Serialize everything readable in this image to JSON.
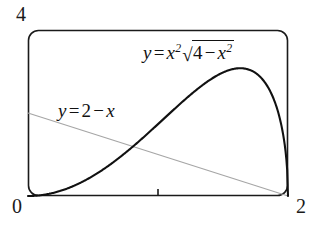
{
  "figure": {
    "type": "function-graph",
    "background_color": "#ffffff",
    "frame": {
      "style": "rounded-rectangle",
      "stroke_color": "#1a1a1a",
      "corner_radius": 10,
      "x_px": 28,
      "y_px": 30,
      "width_px": 260,
      "height_px": 166
    },
    "axis_corner_labels": {
      "y_max": "4",
      "origin": "0",
      "x_max": "2"
    },
    "x_tick_marks": [
      {
        "value": 1,
        "label": ""
      }
    ]
  },
  "annotations": {
    "curve_label": {
      "name": "y = x^2*sqrt(4 - x^2)",
      "lhs_variable": "y",
      "equals": "=",
      "base": "x",
      "base_exponent": "2",
      "radicand_first": "4",
      "radicand_operator": "−",
      "radicand_variable": "x",
      "radicand_exponent": "2",
      "radical_glyph": "√"
    },
    "line_label": {
      "name": "y = 2 - x",
      "lhs_variable": "y",
      "equals": "=",
      "constant": "2",
      "operator": "−",
      "variable": "x"
    }
  },
  "chart_data": {
    "type": "line",
    "title": "",
    "subtitle": "",
    "xlabel": "",
    "ylabel": "",
    "xlim": [
      0,
      2
    ],
    "ylim": [
      0,
      4
    ],
    "xticks": [
      0,
      1,
      2
    ],
    "xticklabels": [
      "0",
      "",
      "2"
    ],
    "yticks": [
      0,
      4
    ],
    "yticklabels": [
      "0",
      "4"
    ],
    "grid": false,
    "legend": "none",
    "axes_style": "boxed-rounded-frame",
    "series": [
      {
        "name": "y = x^2√(4 − x^2)",
        "label_text": "y = x²√(4 − x²)",
        "color": "#111111",
        "linewidth": 2.1,
        "style": "solid",
        "x": [
          0.0,
          0.1,
          0.2,
          0.3,
          0.4,
          0.5,
          0.6,
          0.7,
          0.8,
          0.9,
          1.0,
          1.1,
          1.2,
          1.3,
          1.4,
          1.5,
          1.6,
          1.65,
          1.7,
          1.75,
          1.8,
          1.85,
          1.9,
          1.93,
          1.95,
          1.97,
          1.98,
          1.99,
          1.995,
          2.0
        ],
        "y": [
          0.0,
          0.02,
          0.08,
          0.178,
          0.314,
          0.484,
          0.686,
          0.917,
          1.173,
          1.447,
          1.732,
          2.017,
          2.285,
          2.515,
          2.678,
          2.74,
          2.662,
          2.557,
          2.403,
          2.19,
          1.901,
          1.513,
          0.994,
          0.572,
          0.308,
          0.265,
          0.196,
          0.14,
          0.099,
          0.0
        ],
        "peak": {
          "x": 1.633,
          "y": 3.079
        },
        "endpoints": [
          {
            "x": 0,
            "y": 0
          },
          {
            "x": 2,
            "y": 0
          }
        ]
      },
      {
        "name": "y = 2 − x",
        "label_text": "y = 2 − x",
        "color": "#a6a6a6",
        "linewidth": 1.2,
        "style": "solid",
        "x": [
          0,
          2
        ],
        "y": [
          2,
          0
        ],
        "endpoints": [
          {
            "x": 0,
            "y": 2
          },
          {
            "x": 2,
            "y": 0
          }
        ]
      }
    ],
    "intersections": [
      {
        "x": 0.818,
        "y": 1.182
      }
    ]
  }
}
